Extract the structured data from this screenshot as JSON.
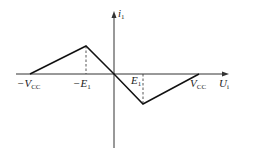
{
  "diagram": {
    "type": "piecewise-linear transfer characteristic",
    "axes": {
      "x_label": "U",
      "x_label_sub": "i",
      "y_label": "i",
      "y_label_sub": "1"
    },
    "ticks": {
      "neg_vcc": {
        "main": "−V",
        "sub": "CC"
      },
      "neg_e1": {
        "main": "−E",
        "sub": "1"
      },
      "e1": {
        "main": "E",
        "sub": "1"
      },
      "vcc": {
        "main": "V",
        "sub": "CC"
      }
    },
    "curve_points": [
      {
        "name": "-Vcc",
        "x": -1.0,
        "y": 0
      },
      {
        "name": "peak",
        "x": -0.33,
        "y": 1
      },
      {
        "name": "origin",
        "x": 0,
        "y": 0
      },
      {
        "name": "trough",
        "x": 0.33,
        "y": -1
      },
      {
        "name": "Vcc",
        "x": 1.0,
        "y": 0
      }
    ],
    "colors": {
      "line": "#111111",
      "axis": "#333333",
      "dashed": "#444444"
    }
  }
}
